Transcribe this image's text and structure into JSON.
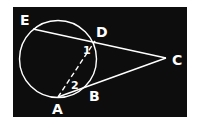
{
  "diagram": {
    "type": "geometry-circle-secants",
    "background_color": "#0d0d0d",
    "stroke_color": "#ffffff",
    "circle": {
      "cx": 58,
      "cy": 59,
      "r": 38.5
    },
    "points": {
      "E": {
        "label": "E",
        "x": 33,
        "y": 29,
        "label_x": 20,
        "label_y": 25
      },
      "D": {
        "label": "D",
        "x": 95,
        "y": 41,
        "label_x": 96,
        "label_y": 37
      },
      "C": {
        "label": "C",
        "x": 166,
        "y": 58,
        "label_x": 172,
        "label_y": 65
      },
      "B": {
        "label": "B",
        "x": 86,
        "y": 86,
        "label_x": 89,
        "label_y": 101
      },
      "A": {
        "label": "A",
        "x": 58,
        "y": 97,
        "label_x": 52,
        "label_y": 114
      }
    },
    "angle_labels": {
      "angle1": {
        "label": "1",
        "x": 83,
        "y": 54
      },
      "angle2": {
        "label": "2",
        "x": 71,
        "y": 89
      }
    },
    "segments": [
      {
        "from": "E",
        "to": "C",
        "style": "solid"
      },
      {
        "from": "A",
        "to": "C",
        "style": "solid"
      },
      {
        "from": "A",
        "to": "D",
        "style": "dashed"
      }
    ]
  }
}
